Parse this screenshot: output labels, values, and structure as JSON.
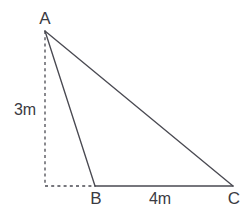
{
  "figure": {
    "type": "geometry-diagram",
    "shape": "triangle",
    "background_color": "#ffffff",
    "stroke_color": "#4a4a52",
    "text_color": "#3a3a42",
    "stroke_width": 1.3,
    "canvas": {
      "width": 252,
      "height": 213
    },
    "vertices": [
      {
        "id": "A",
        "label": "A",
        "x": 45,
        "y": 31,
        "label_x": 45,
        "label_y": 18
      },
      {
        "id": "B",
        "label": "B",
        "x": 95,
        "y": 186,
        "label_x": 96,
        "label_y": 198
      },
      {
        "id": "C",
        "label": "C",
        "x": 233,
        "y": 186,
        "label_x": 234,
        "label_y": 198
      }
    ],
    "edges": [
      {
        "id": "AB",
        "from": "A",
        "to": "B",
        "style": "solid"
      },
      {
        "id": "BC",
        "from": "B",
        "to": "C",
        "style": "solid"
      },
      {
        "id": "AC",
        "from": "A",
        "to": "C",
        "style": "solid"
      }
    ],
    "construction_lines": [
      {
        "id": "height-dashed",
        "x1": 45,
        "y1": 31,
        "x2": 45,
        "y2": 186,
        "style": "dashed"
      },
      {
        "id": "foot-dashed",
        "x1": 45,
        "y1": 186,
        "x2": 95,
        "y2": 186,
        "style": "dashed"
      }
    ],
    "measurements": {
      "height_label": "3m",
      "base_label": "4m"
    }
  }
}
